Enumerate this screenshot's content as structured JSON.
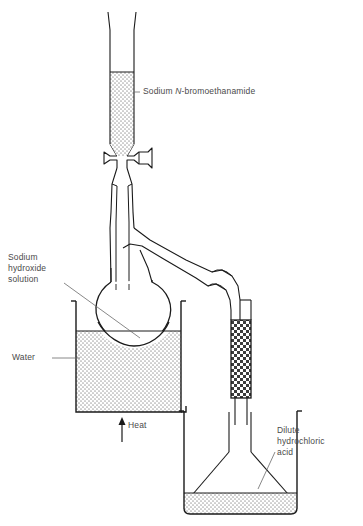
{
  "figure": {
    "background_color": "#ffffff",
    "line_color": "#1a1a1a",
    "label_color": "#4a4a4a",
    "fill_stipple_color": "#b9b9b9",
    "fill_checker_color": "#3a3a3a"
  },
  "labels": {
    "reagent": {
      "prefix": "Sodium ",
      "italic": "N",
      "suffix": "-bromoethanamide"
    },
    "sodium_hydroxide": "Sodium\nhydroxide\nsolution",
    "water": "Water",
    "heat": "Heat",
    "hydrochloric_acid": "Dilute\nhydrochloric\nacid"
  },
  "components": [
    {
      "name": "dropping-funnel",
      "contents": "Sodium N-bromoethanamide",
      "fill": "stipple"
    },
    {
      "name": "stopcock-tap",
      "contents": "",
      "fill": "none"
    },
    {
      "name": "round-bottom-flask",
      "contents": "Sodium hydroxide solution",
      "fill": "none"
    },
    {
      "name": "water-bath-beaker",
      "contents": "Water",
      "fill": "stipple"
    },
    {
      "name": "bunsen-heat-arrow",
      "contents": "Heat",
      "fill": "none"
    },
    {
      "name": "delivery-tube",
      "contents": "",
      "fill": "none"
    },
    {
      "name": "drying-tube",
      "contents": "",
      "fill": "checker"
    },
    {
      "name": "conical-flask",
      "contents": "",
      "fill": "none"
    },
    {
      "name": "collection-beaker",
      "contents": "Dilute hydrochloric acid",
      "fill": "stipple"
    }
  ]
}
